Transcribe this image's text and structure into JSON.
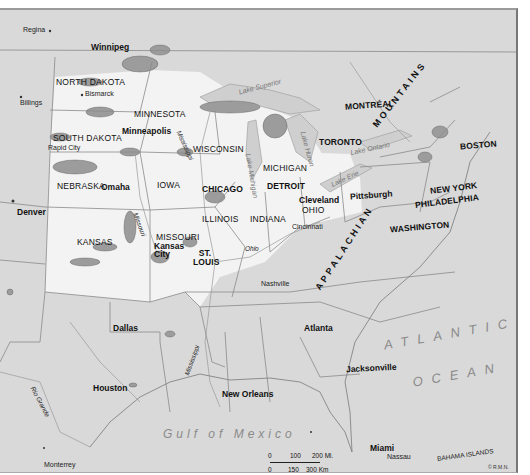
{
  "map": {
    "region": "Central and Eastern United States",
    "credit": "© R.M.N.",
    "colors": {
      "land_outside": "#d9d9d9",
      "highlight_region": "#f2f2f2",
      "patch_fill": "#9c9c9c",
      "boundary_line": "#8a8a8a",
      "label_text": "#111111"
    },
    "labels": {
      "canada_cities": [
        "Regina",
        "Winnipeg",
        "TORONTO",
        "MONTRÉAL"
      ],
      "states": [
        "NORTH DAKOTA",
        "SOUTH DAKOTA",
        "MINNESOTA",
        "WISCONSIN",
        "MICHIGAN",
        "IOWA",
        "NEBRASKA",
        "KANSAS",
        "MISSOURI",
        "ILLINOIS",
        "INDIANA",
        "OHIO"
      ],
      "cities": {
        "regina": "Regina",
        "winnipeg": "Winnipeg",
        "billings": "Billings",
        "bismarck": "Bismarck",
        "minneapolis": "Minneapolis",
        "rapid_city": "Rapid City",
        "omaha": "Omaha",
        "denver": "Denver",
        "kansas_city": "Kansas City",
        "st_louis": "ST. LOUIS",
        "chicago": "CHICAGO",
        "detroit": "DETROIT",
        "cleveland": "Cleveland",
        "cincinnati": "Cincinnati",
        "pittsburgh": "Pittsburgh",
        "toronto": "TORONTO",
        "montreal": "MONTRÉAL",
        "boston": "BOSTON",
        "new_york": "NEW YORK",
        "philadelphia": "PHILADELPHIA",
        "washington": "WASHINGTON",
        "nashville": "Nashville",
        "atlanta": "Atlanta",
        "dallas": "Dallas",
        "houston": "Houston",
        "new_orleans": "New Orleans",
        "jacksonville": "Jacksonville",
        "miami": "Miami",
        "nassau": "Nassau",
        "monterrey": "Monterrey"
      },
      "states_map": {
        "north_dakota": "NORTH DAKOTA",
        "south_dakota": "SOUTH DAKOTA",
        "minnesota": "MINNESOTA",
        "wisconsin": "WISCONSIN",
        "michigan": "MICHIGAN",
        "iowa": "IOWA",
        "nebraska": "NEBRASKA",
        "kansas": "KANSAS",
        "missouri": "MISSOURI",
        "illinois": "ILLINOIS",
        "indiana": "INDIANA",
        "ohio": "OHIO"
      },
      "rivers": {
        "missouri": "Missouri",
        "mississippi_upper": "Mississippi",
        "mississippi_lower": "Mississippi",
        "ohio": "Ohio",
        "rio_grande": "Rio Grande"
      },
      "lakes": {
        "superior": "Lake Superior",
        "michigan": "Lake Michigan",
        "huron": "Lake Huron",
        "erie": "Lake Erie",
        "ontario": "Lake Ontario"
      },
      "features": {
        "appalachian": "APPALACHIAN",
        "mountains": "MOUNTAINS",
        "atlantic": "ATLANTIC",
        "ocean": "OCEAN",
        "gulf": "Gulf of Mexico",
        "bahamas": "BAHAMA ISLANDS"
      }
    },
    "scale_bar": {
      "miles": [
        "0",
        "100",
        "200 Mi."
      ],
      "km": [
        "0",
        "150",
        "300 Km"
      ]
    }
  }
}
